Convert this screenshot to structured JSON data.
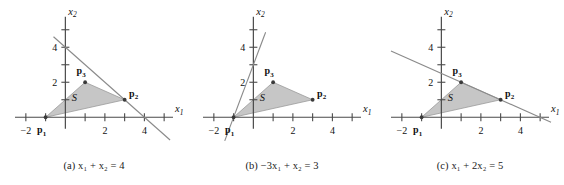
{
  "figure": {
    "panel_count": 3,
    "colors": {
      "shade_fill": "#c6c6c6",
      "shade_stroke": "#9a9a9a",
      "line_color": "#8a8a8a",
      "axis_color": "#4a4a4a",
      "text_color": "#111111"
    }
  },
  "chart_data": [
    {
      "type": "scatter",
      "id": "panel-a",
      "title": "(a) x1 + x2 = 4",
      "caption_parts": {
        "prefix": "(a) ",
        "term1_var": "x",
        "term1_sub": "1",
        "op": " + ",
        "term2_var": "x",
        "term2_sub": "2",
        "eq": " = ",
        "rhs": "4"
      },
      "xlabel": "x1",
      "ylabel": "x2",
      "xlim": [
        -2.6,
        5.6
      ],
      "ylim": [
        -0.9,
        5.9
      ],
      "grid": false,
      "legend": "none",
      "x_ticks": [
        -2,
        -1,
        0,
        1,
        2,
        3,
        4,
        5
      ],
      "x_tick_labels": {
        "-2": "−2",
        "2": "2",
        "4": "4"
      },
      "y_ticks": [
        1,
        2,
        3,
        4,
        5
      ],
      "y_tick_labels": {
        "2": "2",
        "4": "4"
      },
      "polygon": {
        "name": "S",
        "label": "S",
        "label_at": [
          0.45,
          0.95
        ],
        "vertices": [
          [
            -1,
            0
          ],
          [
            3,
            1
          ],
          [
            1,
            2
          ]
        ]
      },
      "points": [
        {
          "name": "p1",
          "label": "p",
          "sub": "1",
          "x": -1,
          "y": 0,
          "label_dx": -4,
          "label_dy": 16
        },
        {
          "name": "p2",
          "label": "p",
          "sub": "2",
          "x": 3,
          "y": 1,
          "label_dx": 9,
          "label_dy": -3
        },
        {
          "name": "p3",
          "label": "p",
          "sub": "3",
          "x": 1,
          "y": 2,
          "label_dx": -4,
          "label_dy": -8
        }
      ],
      "line": {
        "equation": "x1 + x2 = 4",
        "a": 1,
        "b": 1,
        "c": 4,
        "from": [
          -0.6,
          4.6
        ],
        "to": [
          5.3,
          -1.3
        ]
      }
    },
    {
      "type": "scatter",
      "id": "panel-b",
      "title": "(b) -3x1 + x2 = 3",
      "caption_parts": {
        "prefix": "(b) ",
        "coef": "−3",
        "term1_var": "x",
        "term1_sub": "1",
        "op": " + ",
        "term2_var": "x",
        "term2_sub": "2",
        "eq": " = ",
        "rhs": "3"
      },
      "xlabel": "x1",
      "ylabel": "x2",
      "xlim": [
        -2.6,
        5.6
      ],
      "ylim": [
        -0.9,
        5.9
      ],
      "grid": false,
      "legend": "none",
      "x_ticks": [
        -2,
        -1,
        0,
        1,
        2,
        3,
        4,
        5
      ],
      "x_tick_labels": {
        "-2": "−2",
        "2": "2",
        "4": "4"
      },
      "y_ticks": [
        1,
        2,
        3,
        4,
        5
      ],
      "y_tick_labels": {
        "2": "2",
        "4": "4"
      },
      "polygon": {
        "name": "S",
        "label": "S",
        "label_at": [
          0.45,
          0.95
        ],
        "vertices": [
          [
            -1,
            0
          ],
          [
            3,
            1
          ],
          [
            1,
            2
          ]
        ]
      },
      "points": [
        {
          "name": "p1",
          "label": "p",
          "sub": "1",
          "x": -1,
          "y": 0,
          "label_dx": -4,
          "label_dy": 16
        },
        {
          "name": "p2",
          "label": "p",
          "sub": "2",
          "x": 3,
          "y": 1,
          "label_dx": 9,
          "label_dy": -3
        },
        {
          "name": "p3",
          "label": "p",
          "sub": "3",
          "x": 1,
          "y": 2,
          "label_dx": -4,
          "label_dy": -8
        }
      ],
      "line": {
        "equation": "-3x1 + x2 = 3",
        "a": -3,
        "b": 1,
        "c": 3,
        "from": [
          -1.45,
          -1.35
        ],
        "to": [
          0.62,
          4.86
        ]
      }
    },
    {
      "type": "scatter",
      "id": "panel-c",
      "title": "(c) x1 + 2x2 = 5",
      "caption_parts": {
        "prefix": "(c) ",
        "term1_var": "x",
        "term1_sub": "1",
        "op": " + ",
        "coef2": "2",
        "term2_var": "x",
        "term2_sub": "2",
        "eq": " = ",
        "rhs": "5"
      },
      "xlabel": "x1",
      "ylabel": "x2",
      "xlim": [
        -2.6,
        5.6
      ],
      "ylim": [
        -0.9,
        5.9
      ],
      "grid": false,
      "legend": "none",
      "x_ticks": [
        -2,
        -1,
        0,
        1,
        2,
        3,
        4,
        5
      ],
      "x_tick_labels": {
        "-2": "−2",
        "2": "2",
        "4": "4"
      },
      "y_ticks": [
        1,
        2,
        3,
        4,
        5
      ],
      "y_tick_labels": {
        "2": "2",
        "4": "4"
      },
      "polygon": {
        "name": "S",
        "label": "S",
        "label_at": [
          0.45,
          0.95
        ],
        "vertices": [
          [
            -1,
            0
          ],
          [
            3,
            1
          ],
          [
            1,
            2
          ]
        ]
      },
      "points": [
        {
          "name": "p1",
          "label": "p",
          "sub": "1",
          "x": -1,
          "y": 0,
          "label_dx": -4,
          "label_dy": 16
        },
        {
          "name": "p2",
          "label": "p",
          "sub": "2",
          "x": 3,
          "y": 1,
          "label_dx": 9,
          "label_dy": -3
        },
        {
          "name": "p3",
          "label": "p",
          "sub": "3",
          "x": 1,
          "y": 2,
          "label_dx": -4,
          "label_dy": -8
        }
      ],
      "line": {
        "equation": "x1 + 2x2 = 5",
        "a": 1,
        "b": 2,
        "c": 5,
        "from": [
          -2.55,
          3.78
        ],
        "to": [
          5.55,
          -0.28
        ]
      }
    }
  ],
  "axis_labels": {
    "x": "x",
    "x_sub": "1",
    "y": "x",
    "y_sub": "2"
  },
  "captions": {
    "a": "(a) x₁ + x₂ = 4",
    "b": "(b) −3x₁ + x₂ = 3",
    "c": "(c) x₁ + 2x₂ = 5"
  }
}
